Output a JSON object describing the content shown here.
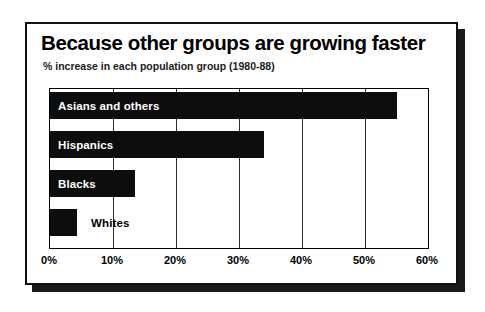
{
  "chart_data": {
    "type": "bar",
    "orientation": "horizontal",
    "title": "Because other groups are growing faster",
    "subtitle": "% increase in each population group (1980-88)",
    "xlabel": "",
    "ylabel": "",
    "xlim": [
      0,
      60
    ],
    "grid": true,
    "legend": "none",
    "categories": [
      "Asians and others",
      "Hispanics",
      "Blacks",
      "Whites"
    ],
    "values": [
      55,
      34,
      13.5,
      4.3
    ],
    "tick_labels": [
      "0%",
      "10%",
      "20%",
      "30%",
      "40%",
      "50%",
      "60%"
    ],
    "tick_values": [
      0,
      10,
      20,
      30,
      40,
      50,
      60
    ],
    "bars": [
      {
        "label": "Asians and others",
        "value": 55,
        "label_position": "inside"
      },
      {
        "label": "Hispanics",
        "value": 34,
        "label_position": "inside"
      },
      {
        "label": "Blacks",
        "value": 13.5,
        "label_position": "inside"
      },
      {
        "label": "Whites",
        "value": 4.3,
        "label_position": "outside"
      }
    ],
    "colors": {
      "bar": "#0d0d0d",
      "background": "#ffffff",
      "axis": "#000000",
      "label_inside": "#ffffff",
      "label_outside": "#000000"
    }
  }
}
